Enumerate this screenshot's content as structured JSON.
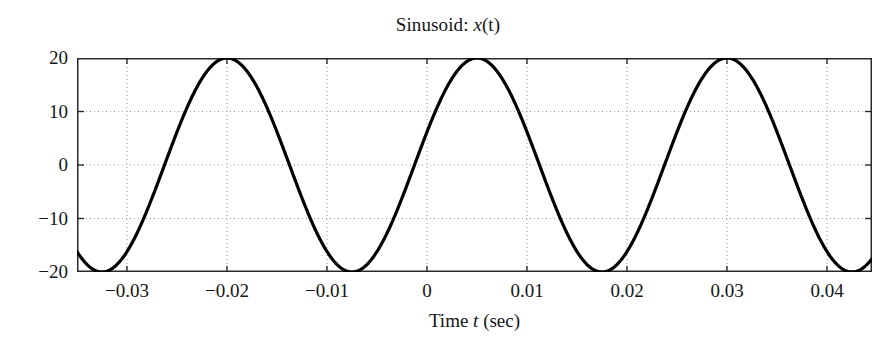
{
  "chart_data": {
    "type": "line",
    "title": "Sinusoid: x(t)",
    "title_parts": {
      "prefix": "Sinusoid: ",
      "symbol": "x",
      "suffix": "(t)"
    },
    "xlabel": "Time t (sec)",
    "xlabel_parts": {
      "prefix": "Time ",
      "symbol": "t",
      "suffix": " (sec)"
    },
    "ylabel": "",
    "xlim": [
      -0.035,
      0.0445
    ],
    "ylim": [
      -20,
      20
    ],
    "xticks": [
      -0.03,
      -0.02,
      -0.01,
      0,
      0.01,
      0.02,
      0.03,
      0.04
    ],
    "xtick_labels": [
      "−0.03",
      "−0.02",
      "−0.01",
      "0",
      "0.01",
      "0.02",
      "0.03",
      "0.04"
    ],
    "yticks": [
      20,
      10,
      0,
      -10,
      -20
    ],
    "ytick_labels": [
      "20",
      "10",
      "0",
      "−10",
      "−20"
    ],
    "grid": true,
    "grid_style": "dotted",
    "grid_color": "#9a9a9a",
    "legend": "none",
    "line_color": "#000000",
    "line_width": 3.2,
    "series": [
      {
        "name": "x(t)",
        "amplitude": 20,
        "frequency_hz": 40,
        "period_sec": 0.025,
        "peaks_at": [
          -0.02,
          0.005,
          0.03
        ],
        "troughs_at": [
          -0.0325,
          -0.0075,
          0.0175,
          0.0425
        ],
        "equation": "x(t) = 20 cos(2π·40·(t + 0.02))",
        "x": [
          -0.035,
          -0.034,
          -0.033,
          -0.032,
          -0.031,
          -0.03,
          -0.029,
          -0.028,
          -0.027,
          -0.026,
          -0.025,
          -0.024,
          -0.023,
          -0.022,
          -0.021,
          -0.02,
          -0.019,
          -0.018,
          -0.017,
          -0.016,
          -0.015,
          -0.014,
          -0.013,
          -0.012,
          -0.011,
          -0.01,
          -0.009,
          -0.008,
          -0.007,
          -0.006,
          -0.005,
          -0.004,
          -0.003,
          -0.002,
          -0.001,
          0,
          0.001,
          0.002,
          0.003,
          0.004,
          0.005,
          0.006,
          0.007,
          0.008,
          0.009,
          0.01,
          0.011,
          0.012,
          0.013,
          0.014,
          0.015,
          0.016,
          0.017,
          0.018,
          0.019,
          0.02,
          0.021,
          0.022,
          0.023,
          0.024,
          0.025,
          0.026,
          0.027,
          0.028,
          0.029,
          0.03,
          0.031,
          0.032,
          0.033,
          0.034,
          0.035,
          0.036,
          0.037,
          0.038,
          0.039,
          0.04,
          0.041,
          0.042,
          0.043,
          0.044,
          0.0445
        ],
        "y": [
          -16.2,
          -18.5,
          -19.8,
          -20.0,
          -19.0,
          -17.0,
          -14.1,
          -10.5,
          -6.4,
          -2.0,
          2.5,
          6.9,
          11.0,
          14.5,
          17.3,
          19.2,
          20.0,
          19.8,
          18.4,
          16.1,
          12.9,
          9.1,
          4.8,
          0.3,
          -4.3,
          -8.5,
          -12.4,
          -15.7,
          -18.1,
          -19.6,
          -20.0,
          -19.3,
          -17.6,
          -15.0,
          -11.5,
          -7.4,
          -3.0,
          1.6,
          6.1,
          10.3,
          13.9,
          16.8,
          18.8,
          19.8,
          19.8,
          18.7,
          16.6,
          13.7,
          10.0,
          5.9,
          1.3,
          -3.3,
          -7.7,
          -11.8,
          -15.4,
          -18.0,
          -19.6,
          -20.0,
          -19.3,
          -17.5,
          -14.8,
          -11.2,
          -7.0,
          -2.6,
          2.0,
          6.4,
          10.6,
          14.2,
          17.1,
          19.0,
          19.9,
          19.7,
          18.3,
          15.9,
          12.6,
          8.7,
          4.3,
          -0.3,
          -4.8,
          -9.0,
          -11.1
        ]
      }
    ]
  }
}
